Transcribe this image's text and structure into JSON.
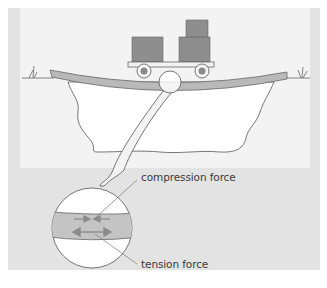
{
  "diagram": {
    "labels": {
      "compression": "compression force",
      "tension": "tension force"
    },
    "colors": {
      "background_panel": "#e4e4e4",
      "upper_panel": "#f4f4f4",
      "pit_fill": "#ffffff",
      "beam": "#b9b9b9",
      "box": "#8e8e8e",
      "cart": "#f2f2f2",
      "wheel_hub": "#8a8a8a",
      "outline": "#555555",
      "arrow": "#8a8a8a",
      "text": "#3a3a3a"
    },
    "elements": [
      "bent beam spanning the pit",
      "cart with two stacked boxes on two wheels",
      "small magnifier circle at beam midpoint",
      "magnified circular inset showing beam cross-section",
      "compression arrows pointing inward on top",
      "tension arrows pointing outward on bottom",
      "grass tufts on both banks"
    ]
  }
}
